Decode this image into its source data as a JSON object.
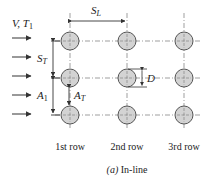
{
  "diagram": {
    "inlet_label": {
      "main": "V, T",
      "sub": "1"
    },
    "spacing_longitudinal": {
      "main": "S",
      "sub": "L"
    },
    "spacing_transverse": {
      "main": "S",
      "sub": "T"
    },
    "area_inlet": {
      "main": "A",
      "sub": "1"
    },
    "area_transverse": {
      "main": "A",
      "sub": "T"
    },
    "diameter": "D",
    "rows": [
      {
        "label": "1st row"
      },
      {
        "label": "2nd row"
      },
      {
        "label": "3rd row"
      }
    ],
    "caption": {
      "letter": "(a)",
      "text": "In-line"
    },
    "colors": {
      "tube_fill": "#d3d3d3",
      "tube_stroke": "#555555",
      "line": "#333333"
    }
  }
}
